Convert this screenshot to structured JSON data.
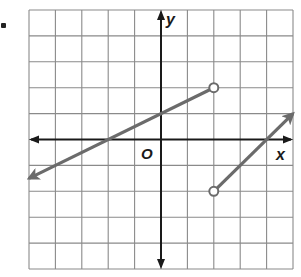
{
  "chart_data": {
    "type": "line",
    "title": "",
    "xlabel": "x",
    "ylabel": "y",
    "origin_label": "O",
    "xlim": [
      -5,
      5
    ],
    "ylim": [
      -5,
      5
    ],
    "grid": true,
    "grid_step": 1,
    "tick_labels_shown": false,
    "series": [
      {
        "name": "left piece",
        "equation": "y = 0.5x + 1, x < 2",
        "points": [
          [
            -5,
            -1.5
          ],
          [
            -2,
            0
          ],
          [
            0,
            1
          ],
          [
            2,
            2
          ]
        ],
        "start": {
          "x": -5,
          "y": -1.5,
          "type": "arrow"
        },
        "end": {
          "x": 2,
          "y": 2,
          "type": "open-circle"
        }
      },
      {
        "name": "right piece",
        "equation": "y = x - 4, x > 2",
        "points": [
          [
            2,
            -2
          ],
          [
            4,
            0
          ],
          [
            5,
            1
          ]
        ],
        "start": {
          "x": 2,
          "y": -2,
          "type": "open-circle"
        },
        "end": {
          "x": 5,
          "y": 1,
          "type": "arrow"
        }
      }
    ]
  },
  "colors": {
    "grid": "#8a8a8a",
    "axis": "#1a1a1a",
    "series": "#6b6b6b",
    "background": "#ffffff"
  }
}
